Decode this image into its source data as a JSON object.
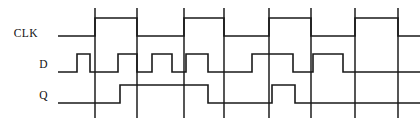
{
  "diagram": {
    "type": "digital-timing-diagram",
    "title": "",
    "canvas": {
      "width": 420,
      "height": 126,
      "background": "#ffffff"
    },
    "style": {
      "wave_color": "#1a1a1a",
      "grid_color": "#2b2b2b",
      "wave_stroke_width": 1.6,
      "grid_stroke_width": 1.6
    },
    "labels": [
      {
        "name": "clk-label",
        "text": "CLK",
        "x": 38,
        "y": 37
      },
      {
        "name": "d-label",
        "text": "D",
        "x": 48,
        "y": 68
      },
      {
        "name": "q-label",
        "text": "Q",
        "x": 48,
        "y": 99
      }
    ],
    "grid": {
      "visible": true,
      "y_top": 8,
      "y_bottom": 118,
      "x_positions": [
        95,
        137,
        184,
        224,
        269,
        311,
        355,
        398
      ]
    },
    "signals": [
      {
        "name": "CLK",
        "row": "clk",
        "x_start": 58,
        "x_end": 420,
        "y_high": 18,
        "y_low": 36,
        "initial_level": 0,
        "transitions": [
          {
            "x": 95,
            "to": 1
          },
          {
            "x": 137,
            "to": 0
          },
          {
            "x": 184,
            "to": 1
          },
          {
            "x": 224,
            "to": 0
          },
          {
            "x": 269,
            "to": 1
          },
          {
            "x": 311,
            "to": 0
          },
          {
            "x": 355,
            "to": 1
          },
          {
            "x": 398,
            "to": 0
          }
        ]
      },
      {
        "name": "D",
        "row": "d",
        "x_start": 58,
        "x_end": 420,
        "y_high": 54,
        "y_low": 72,
        "initial_level": 0,
        "transitions": [
          {
            "x": 77,
            "to": 1
          },
          {
            "x": 90,
            "to": 0
          },
          {
            "x": 118,
            "to": 1
          },
          {
            "x": 137,
            "to": 0
          },
          {
            "x": 152,
            "to": 1
          },
          {
            "x": 172,
            "to": 0
          },
          {
            "x": 186,
            "to": 1
          },
          {
            "x": 208,
            "to": 0
          },
          {
            "x": 252,
            "to": 1
          },
          {
            "x": 293,
            "to": 0
          },
          {
            "x": 313,
            "to": 1
          },
          {
            "x": 343,
            "to": 0
          }
        ]
      },
      {
        "name": "Q",
        "row": "q",
        "x_start": 58,
        "x_end": 420,
        "y_high": 85,
        "y_low": 103,
        "initial_level": 0,
        "transitions": [
          {
            "x": 120,
            "to": 1
          },
          {
            "x": 208,
            "to": 0
          },
          {
            "x": 272,
            "to": 1
          },
          {
            "x": 295,
            "to": 0
          }
        ]
      }
    ]
  }
}
